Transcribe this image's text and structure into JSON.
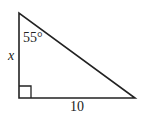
{
  "figure": {
    "type": "right-triangle",
    "stroke_color": "#222222",
    "background": "#ffffff",
    "vertices": {
      "top": [
        19,
        13
      ],
      "right_angle": [
        19,
        98
      ],
      "right": [
        135,
        98
      ]
    },
    "labels": {
      "angle": "55°",
      "vertical_side": "x",
      "horizontal_side": "10"
    }
  }
}
